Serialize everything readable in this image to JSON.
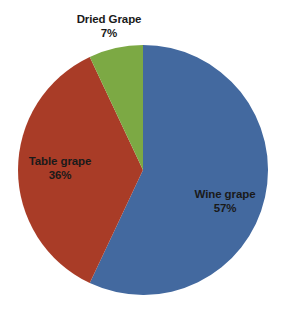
{
  "chart_data": {
    "type": "pie",
    "title": "",
    "categories": [
      "Wine grape",
      "Table grape",
      "Dried Grape"
    ],
    "values": [
      57,
      36,
      7
    ],
    "unit": "%",
    "legend": "none",
    "labels_position": "inside-and-outside",
    "start_angle_deg": 0,
    "direction": "clockwise",
    "colors": [
      "#43699f",
      "#a93c27",
      "#7ca944"
    ],
    "background": "#ffffff",
    "slices": [
      {
        "name": "Wine grape",
        "value": 57,
        "value_label": "57%",
        "color": "#43699f",
        "label_placement": "inside"
      },
      {
        "name": "Table grape",
        "value": 36,
        "value_label": "36%",
        "color": "#a93c27",
        "label_placement": "inside"
      },
      {
        "name": "Dried Grape",
        "value": 7,
        "value_label": "7%",
        "color": "#7ca944",
        "label_placement": "outside-top"
      }
    ]
  },
  "geometry": {
    "center_x": 143,
    "center_y": 170,
    "radius": 125
  }
}
